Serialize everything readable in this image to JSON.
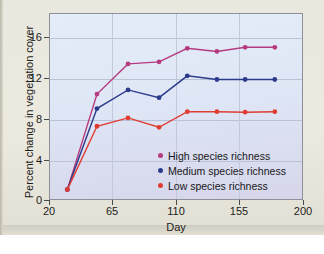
{
  "chart_data": {
    "type": "line",
    "title": "",
    "xlabel": "Day",
    "ylabel": "Percent change in vegetation cover",
    "xlim": [
      20,
      200
    ],
    "ylim": [
      0,
      18
    ],
    "xticks": [
      "20",
      "65",
      "110",
      "155",
      "200"
    ],
    "xtick_values": [
      20,
      65,
      110,
      155,
      200
    ],
    "yticks": [
      "0",
      "4",
      "8",
      "12",
      "16"
    ],
    "ytick_values": [
      0,
      4,
      8,
      12,
      16
    ],
    "grid": "horizontal-and-vertical",
    "legend_position": "inside-lower-right",
    "x": [
      33,
      54,
      76,
      98,
      118,
      139,
      159,
      180
    ],
    "series": [
      {
        "name": "High species richness",
        "color": "#b63a7f",
        "values": [
          1.0,
          10.2,
          13.1,
          13.3,
          14.6,
          14.3,
          14.7,
          14.7
        ]
      },
      {
        "name": "Medium species richness",
        "color": "#2c3a8c",
        "values": [
          1.0,
          8.8,
          10.6,
          9.85,
          11.95,
          11.6,
          11.6,
          11.6
        ]
      },
      {
        "name": "Low species richness",
        "color": "#e03c31",
        "values": [
          1.0,
          7.1,
          7.9,
          7.0,
          8.5,
          8.5,
          8.45,
          8.5
        ]
      }
    ]
  },
  "legend": {
    "items": [
      {
        "label": "High species richness",
        "color": "#b63a7f"
      },
      {
        "label": "Medium species richness",
        "color": "#2c3a8c"
      },
      {
        "label": "Low species richness",
        "color": "#e03c31"
      }
    ]
  },
  "axes": {
    "x_title": "Day",
    "y_title": "Percent change in vegetation cover"
  }
}
